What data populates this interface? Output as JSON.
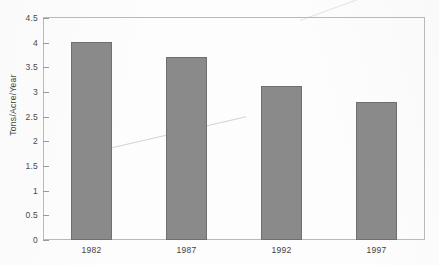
{
  "chart_data": {
    "type": "bar",
    "title": "",
    "subtitle": "",
    "xlabel": "",
    "ylabel": "Tons/Acre/Year",
    "categories": [
      "1982",
      "1987",
      "1992",
      "1997"
    ],
    "values": [
      4.02,
      3.7,
      3.12,
      2.8
    ],
    "ylim": [
      0,
      4.5
    ],
    "ytick_labels": [
      "0",
      "0.5",
      "1",
      "1.5",
      "2",
      "2.5",
      "3",
      "3.5",
      "4",
      "4.5"
    ],
    "ytick_values": [
      0,
      0.5,
      1,
      1.5,
      2,
      2.5,
      3,
      3.5,
      4,
      4.5
    ],
    "grid": false,
    "legend": null,
    "legend_position": "none",
    "series": [
      {
        "name": "",
        "values": [
          4.02,
          3.7,
          3.12,
          2.8
        ]
      }
    ],
    "colors": {
      "bar_fill": "#8a8a8a",
      "bar_stroke": "#6f6f6f",
      "frame": "#b9b9b9",
      "text": "#3f3f3f",
      "background": "#fdfdfd"
    }
  }
}
